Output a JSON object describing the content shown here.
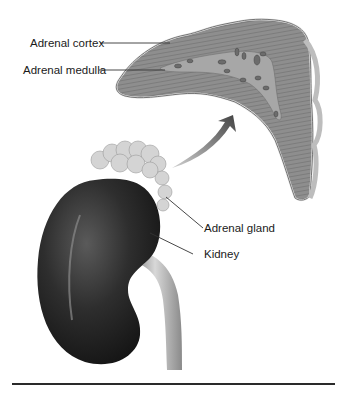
{
  "diagram": {
    "labels": {
      "adrenal_cortex": "Adrenal cortex",
      "adrenal_medulla": "Adrenal medulla",
      "adrenal_gland": "Adrenal gland",
      "kidney": "Kidney"
    },
    "colors": {
      "kidney": "#2b2b2b",
      "gland": "#cfcfcf",
      "cross_section": "#9a9a9a",
      "arrow": "#555555",
      "leader_line": "#333333"
    }
  }
}
